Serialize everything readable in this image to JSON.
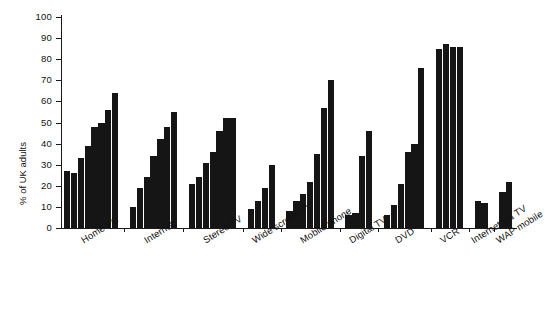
{
  "chart": {
    "type": "bar",
    "title": "",
    "ylabel": "% of UK adults",
    "xlabel": "",
    "ylim": [
      0,
      100
    ],
    "ytick_values": [
      0,
      10,
      20,
      30,
      40,
      50,
      60,
      70,
      80,
      90,
      100
    ],
    "ytick_labels": [
      "0",
      "10",
      "20",
      "30",
      "40",
      "50",
      "60",
      "70",
      "80",
      "90",
      "100"
    ],
    "grid": false,
    "legend": "none",
    "bar_color": "#151515",
    "axis_color": "#1a1a1a"
  },
  "chart_data": {
    "type": "bar",
    "title": "",
    "xlabel": "",
    "ylabel": "% of UK adults",
    "ylim": [
      0,
      100
    ],
    "grid": false,
    "legend": "none",
    "categories": [
      "Home PC",
      "Internet",
      "Stereo TV",
      "Wide screen TV",
      "Mobile phone",
      "Digital TV",
      "DVD",
      "VCR",
      "Internet via TV",
      "WAP mobile"
    ],
    "groups": [
      {
        "category": "Home PC",
        "values": [
          27,
          26,
          33,
          39,
          48,
          50,
          56,
          64
        ]
      },
      {
        "category": "Internet",
        "values": [
          10,
          19,
          24,
          34,
          42,
          48,
          55
        ]
      },
      {
        "category": "Stereo TV",
        "values": [
          21,
          24,
          31,
          36,
          46,
          52,
          52
        ]
      },
      {
        "category": "Wide screen TV",
        "values": [
          9,
          13,
          19,
          30
        ]
      },
      {
        "category": "Mobile phone",
        "values": [
          8,
          13,
          16,
          22,
          35,
          57,
          70
        ]
      },
      {
        "category": "Digital TV",
        "values": [
          6,
          7,
          34,
          46
        ]
      },
      {
        "category": "DVD",
        "values": [
          6,
          11,
          21,
          36,
          40,
          76
        ]
      },
      {
        "category": "VCR",
        "values": [
          85,
          87,
          86,
          86
        ]
      },
      {
        "category": "Internet via TV",
        "values": [
          13,
          12
        ]
      },
      {
        "category": "WAP mobile",
        "values": [
          17,
          22
        ]
      }
    ]
  }
}
